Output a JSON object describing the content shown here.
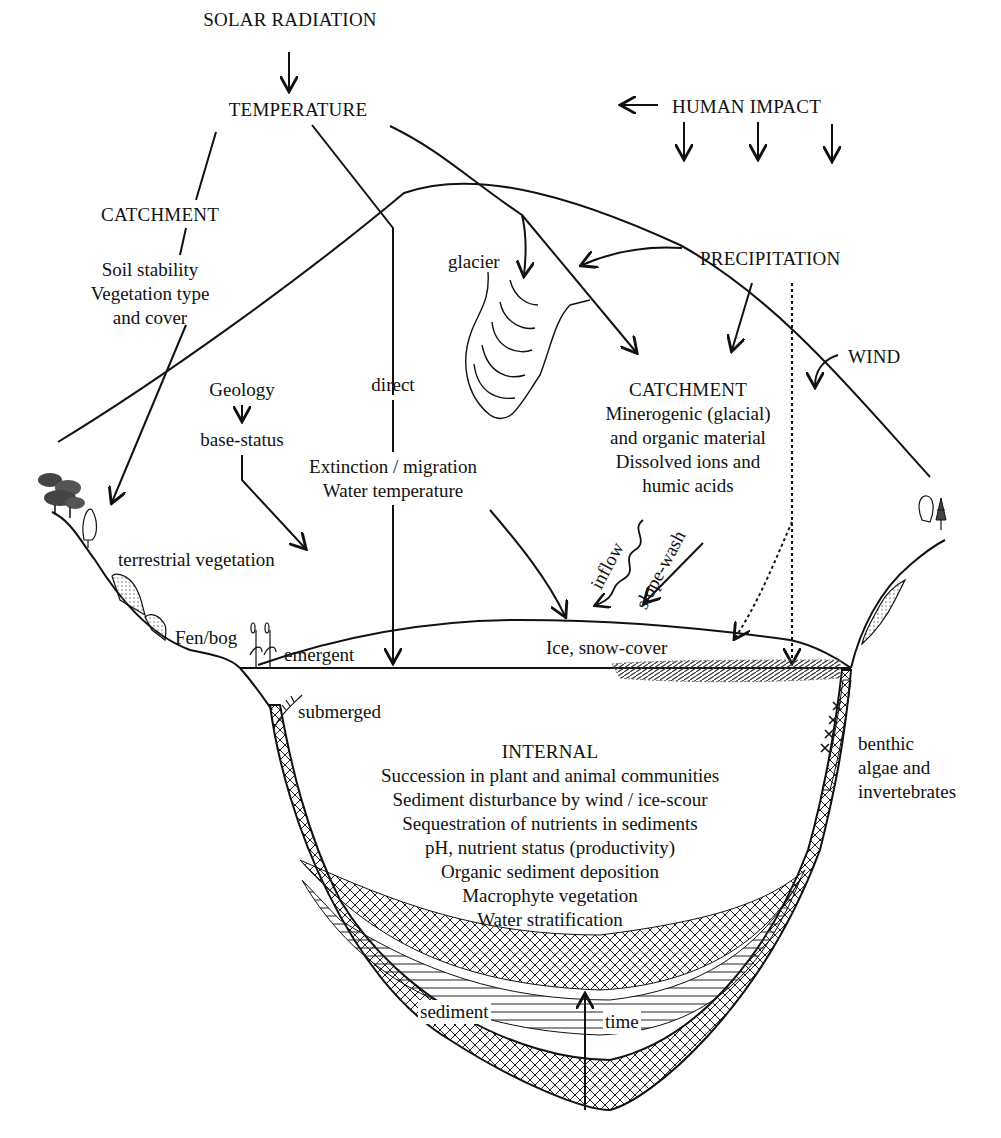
{
  "top": {
    "solar_radiation": "SOLAR RADIATION",
    "temperature": "TEMPERATURE",
    "human_impact": "HUMAN IMPACT"
  },
  "left_catchment": {
    "title": "CATCHMENT",
    "lines": [
      "Soil stability",
      "Vegetation type",
      "and cover"
    ]
  },
  "geology": {
    "label": "Geology",
    "base_status": "base-status",
    "terrestrial_vegetation": "terrestrial vegetation"
  },
  "direct": {
    "label": "direct",
    "effects": [
      "Extinction / migration",
      "Water temperature"
    ]
  },
  "glacier": "glacier",
  "precipitation": "PRECIPITATION",
  "wind": "WIND",
  "right_catchment": {
    "title": "CATCHMENT",
    "lines": [
      "Minerogenic (glacial)",
      "and organic material",
      "Dissolved ions and",
      "humic acids"
    ]
  },
  "inputs": {
    "inflow": "inflow",
    "slope_wash": "slope-wash",
    "ice_snow": "Ice, snow-cover"
  },
  "shore": {
    "fen_bog": "Fen/bog",
    "emergent": "emergent",
    "submerged": "submerged",
    "benthic": [
      "benthic",
      "algae and",
      "invertebrates"
    ]
  },
  "internal": {
    "title": "INTERNAL",
    "lines": [
      "Succession in plant and animal communities",
      "Sediment disturbance by wind / ice-scour",
      "Sequestration of nutrients in sediments",
      "pH, nutrient status (productivity)",
      "Organic sediment deposition",
      "Macrophyte vegetation",
      "Water stratification"
    ]
  },
  "basin": {
    "sediment": "sediment",
    "time": "time"
  }
}
